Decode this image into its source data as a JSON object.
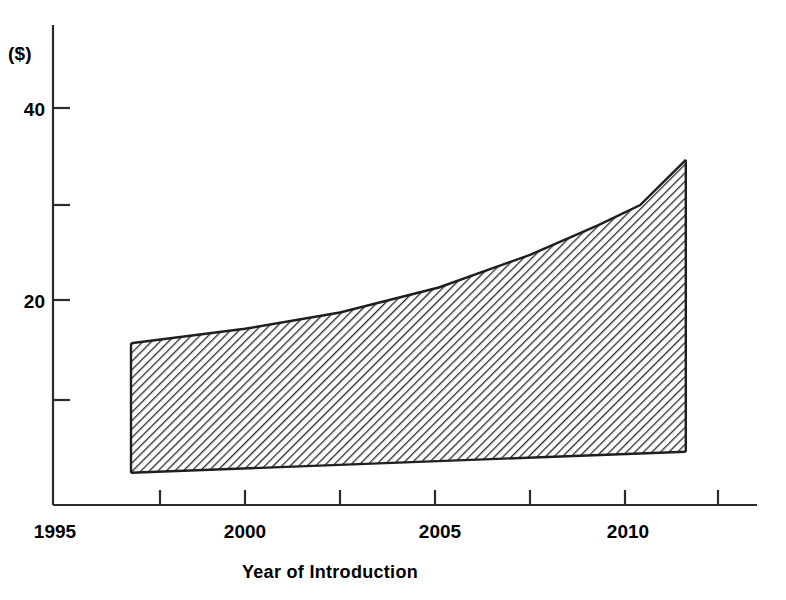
{
  "chart_data": {
    "type": "area",
    "title": "",
    "subtitle": "",
    "xlabel": "Year of Introduction",
    "ylabel": "($)",
    "ylabel_note": "($)",
    "xlim": [
      1995,
      2012.5
    ],
    "ylim": [
      0,
      45
    ],
    "grid": false,
    "legend": false,
    "x_tick_labels": [
      "1995",
      "2000",
      "2005",
      "2010"
    ],
    "x_tick_values": [
      1995,
      2000,
      2005,
      2010
    ],
    "x_minor_tick_values": [
      1997.5,
      2002.5,
      2007.5,
      2012.5
    ],
    "y_tick_labels": [
      "20",
      "40"
    ],
    "y_tick_values": [
      20,
      40
    ],
    "y_minor_tick_values": [
      10,
      30
    ],
    "series": [
      {
        "name": "Upper bound",
        "x": [
          1997.0,
          2000.0,
          2002.5,
          2005.1,
          2007.5,
          2009.3,
          2010.4,
          2011.6
        ],
        "values": [
          15.5,
          17.0,
          18.7,
          21.3,
          24.7,
          27.8,
          29.9,
          34.6
        ]
      },
      {
        "name": "Lower bound",
        "x": [
          1997.0,
          2011.6
        ],
        "values": [
          2.0,
          4.2
        ]
      }
    ],
    "shaded_band": {
      "fill_style": "diagonal-hatch",
      "hatch_angle_deg": -45,
      "hatch_color": "#2a2a2a",
      "background_color": "#ffffff",
      "x_start": 1997.0,
      "x_end": 2011.6
    },
    "colors": {
      "axis": "#2b2b2b",
      "band_outline": "#1f1f1f",
      "text": "#1a1a1a"
    }
  },
  "axis": {
    "y_unit_label": "($)",
    "x_title": "Year of Introduction",
    "y_ticks": [
      {
        "label": "40",
        "value": 40
      },
      {
        "label": "20",
        "value": 20
      }
    ],
    "x_ticks": [
      {
        "label": "1995",
        "value": 1995
      },
      {
        "label": "2000",
        "value": 2000
      },
      {
        "label": "2005",
        "value": 2005
      },
      {
        "label": "2010",
        "value": 2010
      }
    ]
  }
}
